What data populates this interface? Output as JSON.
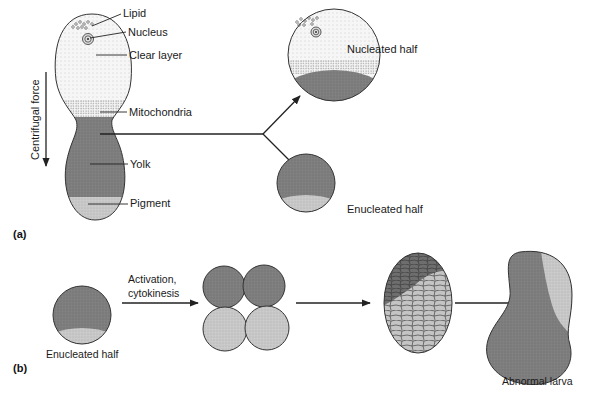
{
  "panel_a": {
    "label": "(a)",
    "force_label": "Centrifugal force",
    "egg_labels": {
      "lipid": "Lipid",
      "nucleus": "Nucleus",
      "clear_layer": "Clear layer",
      "mitochondria": "Mitochondria",
      "yolk": "Yolk",
      "pigment": "Pigment"
    },
    "nucleated_half": "Nucleated half",
    "enucleated_half": "Enucleated half"
  },
  "panel_b": {
    "label": "(b)",
    "start_label": "Enucleated half",
    "activation_line1": "Activation,",
    "activation_line2": "cytokinesis",
    "end_label": "Abnormal larva"
  },
  "colors": {
    "yolk": "#7e7e7e",
    "pigment": "#c9c9c9",
    "clear": "#f4f4f4",
    "mitochondria": "#d8d8d8",
    "outline": "#333333"
  }
}
